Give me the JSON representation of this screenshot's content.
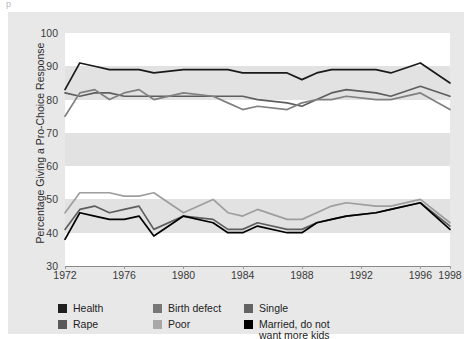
{
  "chart_data": {
    "type": "line",
    "title": "",
    "xlabel": "",
    "ylabel": "Percentage  Giving a Pro-Choice Response",
    "xlim": [
      1972,
      1998
    ],
    "ylim": [
      30,
      100
    ],
    "yticks": [
      30,
      40,
      50,
      60,
      70,
      80,
      90,
      100
    ],
    "xticks": [
      1972,
      1976,
      1980,
      1984,
      1988,
      1992,
      1996,
      1998
    ],
    "grid": "alternating horizontal bands",
    "legend_position": "below-plot",
    "x": [
      1972,
      1973,
      1974,
      1975,
      1976,
      1977,
      1978,
      1980,
      1982,
      1983,
      1984,
      1985,
      1987,
      1988,
      1989,
      1990,
      1991,
      1993,
      1994,
      1996,
      1998
    ],
    "series": [
      {
        "name": "Health",
        "color": "#1a1a1a",
        "values": [
          83,
          91,
          90,
          89,
          89,
          89,
          88,
          89,
          89,
          89,
          88,
          88,
          88,
          86,
          88,
          89,
          89,
          89,
          88,
          91,
          85
        ]
      },
      {
        "name": "Rape",
        "color": "#5e5e5e",
        "values": [
          82,
          81,
          82,
          82,
          81,
          81,
          81,
          81,
          81,
          81,
          81,
          80,
          79,
          78,
          80,
          82,
          83,
          82,
          81,
          84,
          81
        ]
      },
      {
        "name": "Birth defect",
        "color": "#808080",
        "values": [
          75,
          82,
          83,
          80,
          82,
          83,
          80,
          82,
          81,
          79,
          77,
          78,
          77,
          79,
          80,
          80,
          81,
          80,
          80,
          82,
          77
        ]
      },
      {
        "name": "Poor",
        "color": "#9e9e9e",
        "values": [
          46,
          52,
          52,
          52,
          51,
          51,
          52,
          46,
          50,
          46,
          45,
          47,
          44,
          44,
          46,
          48,
          49,
          48,
          48,
          50,
          43
        ]
      },
      {
        "name": "Single",
        "color": "#5e5e5e",
        "values": [
          41,
          47,
          48,
          46,
          47,
          48,
          41,
          45,
          44,
          41,
          41,
          43,
          41,
          41,
          43,
          44,
          45,
          46,
          47,
          49,
          42
        ]
      },
      {
        "name": "Married, do not want more kids",
        "color": "#000000",
        "values": [
          38,
          46,
          45,
          44,
          44,
          45,
          39,
          45,
          43,
          40,
          40,
          42,
          40,
          40,
          43,
          44,
          45,
          46,
          47,
          49,
          41
        ]
      }
    ]
  },
  "axes": {
    "y_title": "Percentage  Giving a Pro-Choice Response",
    "y_ticks": [
      "100",
      "90",
      "80",
      "70",
      "60",
      "50",
      "40",
      "30"
    ],
    "x_ticks": [
      "1972",
      "1976",
      "1980",
      "1984",
      "1988",
      "1992",
      "1996",
      "1998"
    ]
  },
  "legend": {
    "columns": [
      {
        "items": [
          {
            "label": "Health",
            "color": "#1f1f1f"
          },
          {
            "label": "Rape",
            "color": "#5a5a5a"
          }
        ]
      },
      {
        "items": [
          {
            "label": "Birth defect",
            "color": "#777777"
          },
          {
            "label": "Poor",
            "color": "#a8a8a8"
          }
        ]
      },
      {
        "items": [
          {
            "label": "Single",
            "color": "#636363"
          },
          {
            "label": "Married, do not\nwant more kids",
            "color": "#000000"
          }
        ]
      }
    ]
  },
  "artifacts": {
    "top_glyph": "p"
  }
}
